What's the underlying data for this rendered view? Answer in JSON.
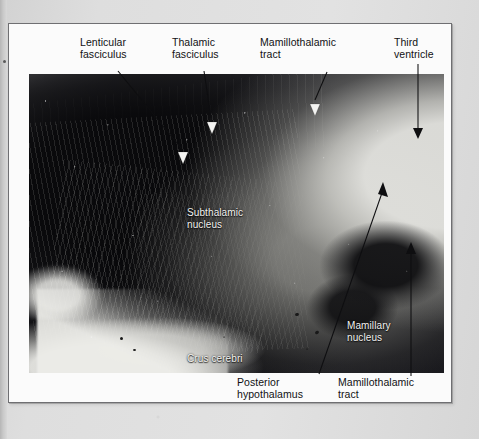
{
  "figure": {
    "kind": "photomicrograph",
    "stain_tone": "monochrome myelin-stained histological section",
    "frame_border_color": "#6f6f72",
    "page_background_color": "#d9d9d9"
  },
  "labels": {
    "external": [
      {
        "id": "lenticular-fasciculus",
        "text": "Lenticular\nfasciculus",
        "position": "top-left",
        "leader": "diagonal line down-right to white arrowhead",
        "arrowhead": "white"
      },
      {
        "id": "thalamic-fasciculus",
        "text": "Thalamic\nfasciculus",
        "position": "top-center-left",
        "leader": "short diagonal line down to white arrowhead",
        "arrowhead": "white"
      },
      {
        "id": "mamillothalamic-tract-top",
        "text": "Mamillothalamic\ntract",
        "position": "top-center-right",
        "leader": "short diagonal line down-left to white arrowhead",
        "arrowhead": "white"
      },
      {
        "id": "third-ventricle",
        "text": "Third\nventricle",
        "position": "top-right",
        "leader": "long vertical line down to black arrowhead",
        "arrowhead": "black"
      },
      {
        "id": "posterior-hypothalamus",
        "text": "Posterior\nhypothalamus",
        "position": "bottom-center",
        "leader": "long diagonal line up-right to black arrowhead",
        "arrowhead": "black"
      },
      {
        "id": "mamillothalamic-tract-bottom",
        "text": "Mamillothalamic\ntract",
        "position": "bottom-right",
        "leader": "long vertical line up to black arrowhead",
        "arrowhead": "black"
      }
    ],
    "overlay": [
      {
        "id": "subthalamic-nucleus",
        "text": "Subthalamic\nnucleus",
        "color": "#f2f2f0",
        "position": "upper-middle of section"
      },
      {
        "id": "crus-cerebri",
        "text": "Crus cerebri",
        "color": "#f2f2f0",
        "position": "lower-middle of section"
      },
      {
        "id": "mamillary-nucleus",
        "text": "Mamillary\nnucleus",
        "color": "#f2f2f0",
        "position": "lower-right of section"
      }
    ]
  }
}
